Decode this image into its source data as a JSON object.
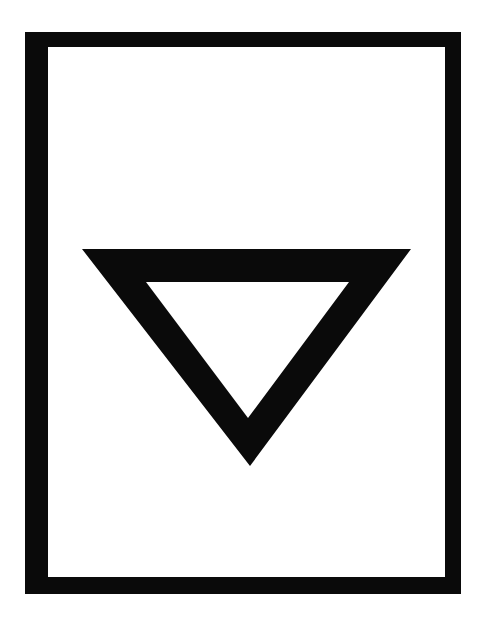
{
  "figure": {
    "title": "Inverted triangle symbol in rectangular frame",
    "colors": {
      "background": "#ffffff",
      "ink": "#0a0a0a"
    },
    "frame": {
      "outer": {
        "x": 25,
        "y": 32,
        "width": 436,
        "height": 562
      },
      "inner": {
        "x": 48,
        "y": 47,
        "width": 397,
        "height": 530
      }
    },
    "triangle": {
      "orientation": "pointing-down",
      "outer_vertices": [
        [
          82,
          249
        ],
        [
          411,
          249
        ],
        [
          250,
          466
        ]
      ],
      "inner_vertices": [
        [
          146,
          282
        ],
        [
          349,
          282
        ],
        [
          248,
          418
        ]
      ]
    }
  }
}
